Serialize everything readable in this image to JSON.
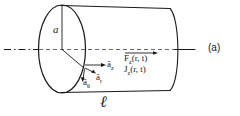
{
  "figure": {
    "part_label": "(a)",
    "caption_symbol": "ℓ",
    "radius_label": "a",
    "colors": {
      "stroke": "#1a1a1a",
      "background": "#ffffff",
      "axis": "#1a1a1a"
    },
    "unit_vectors": [
      {
        "id": "a_z",
        "base": "â",
        "sub": "z",
        "direction": "axial-right"
      },
      {
        "id": "a_r",
        "base": "â",
        "sub": "r",
        "direction": "radial-outward"
      },
      {
        "id": "a_theta",
        "base": "â",
        "sub": "θ",
        "direction": "azimuthal-down"
      }
    ],
    "field_labels": [
      {
        "id": "F_z",
        "base": "F",
        "sub": "z",
        "args": "(r, t)",
        "overbar_arrow": true
      },
      {
        "id": "J_z",
        "base": "J",
        "sub": "z",
        "args": "(r, t)",
        "overbar_arrow": false
      }
    ],
    "geometry": {
      "axis_style": "dash-dot center line",
      "shape": "cylinder",
      "front_face": "ellipse",
      "back_edge": "arc"
    }
  }
}
